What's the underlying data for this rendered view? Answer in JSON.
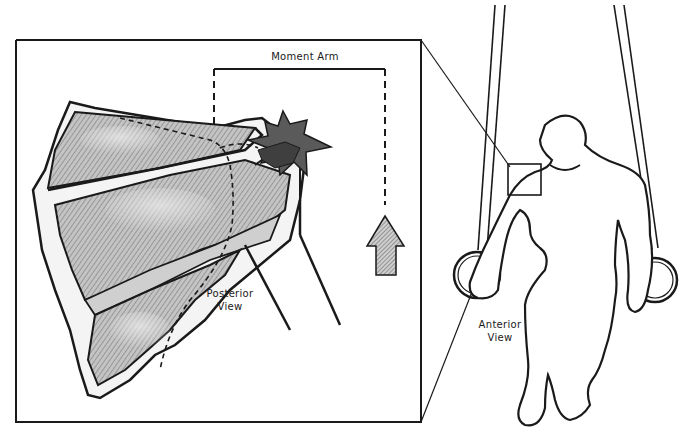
{
  "figure": {
    "type": "illustration"
  },
  "labels": {
    "moment_arm": "Moment Arm",
    "posterior_view_line1": "Posterior",
    "posterior_view_line2": "View",
    "anterior_view_line1": "Anterior",
    "anterior_view_line2": "View"
  },
  "colors": {
    "ink": "#1a1a1a",
    "muscle_fill": "#b8b8b8",
    "muscle_light": "#dcdcdc",
    "star_fill": "#5a5a5a",
    "arrow_fill": "#9a9a9a",
    "background": "#ffffff"
  }
}
